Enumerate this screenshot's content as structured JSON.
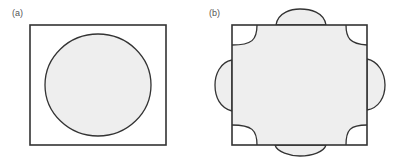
{
  "panels": [
    {
      "label": "(a)",
      "description": "Rectangle containing an inscribed filled circle",
      "shapes": {
        "rect": {
          "x": 30,
          "y": 25,
          "w": 136,
          "h": 120
        },
        "circle": {
          "cx": 98,
          "cy": 85,
          "rx": 53,
          "ry": 51
        }
      }
    },
    {
      "label": "(b)",
      "description": "Square filled region with concave quarter-circle cut-outs at corners and bulging lobes on each edge",
      "shapes": {
        "rect": {
          "x": 232,
          "y": 25,
          "w": 135,
          "h": 120
        }
      }
    }
  ],
  "colors": {
    "stroke": "#333333",
    "fill": "#eeeeee",
    "background": "#ffffff",
    "label": "#555555"
  }
}
